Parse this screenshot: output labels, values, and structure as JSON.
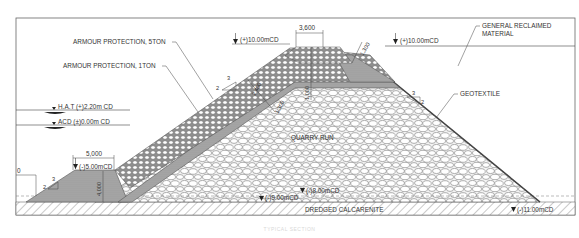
{
  "diagram": {
    "colors": {
      "line": "#444444",
      "frame": "#666666",
      "armour_fill": "#9a9a9a",
      "geotextile_fill": "#8c8c8c",
      "quarry_fill": "#f2f2f2",
      "toe_fill": "#a8a8a8",
      "calcarenite_hatch": "#777777"
    },
    "labels": {
      "armour_5ton": "ARMOUR PROTECTION, 5TON",
      "armour_1ton": "ARMOUR PROTECTION, 1TON",
      "general_reclaimed": "GENERAL RECLAIMED",
      "general_reclaimed_2": "MATERIAL",
      "geotextile": "GEOTEXTILE",
      "quarry_run": "QUARRY RUN",
      "dredged_calcarenite": "DREDGED CALCARENITE"
    },
    "levels": {
      "crest_left": "(+)10.00mCD",
      "crest_right": "(+)10.00mCD",
      "hat": "H.A.T (+)2.20m CD",
      "acd": "ACD (±)0.00m CD",
      "toe_berm": "(-)5.00mCD",
      "seabed_8": "(-)8.00mCD",
      "seabed_9": "(-)9.00mCD",
      "dredge_11": "(-)11.00mCD"
    },
    "dimensions": {
      "crest_width": "3,600",
      "berm_width": "5,000",
      "armour_thickness_top": "1,300",
      "crest_height": "1,000",
      "armour_thickness_slope_1": "2,400",
      "armour_thickness_slope_2": "1,300",
      "toe_height": "4,000",
      "left_cut_dim": "0"
    },
    "slopes": {
      "seaward_upper": {
        "rise": "2",
        "run": "3"
      },
      "seaward_toe": {
        "rise": "2",
        "run": "3"
      },
      "landward": {
        "rise": "2",
        "run": "3"
      }
    },
    "caption": "TYPICAL SECTION"
  }
}
